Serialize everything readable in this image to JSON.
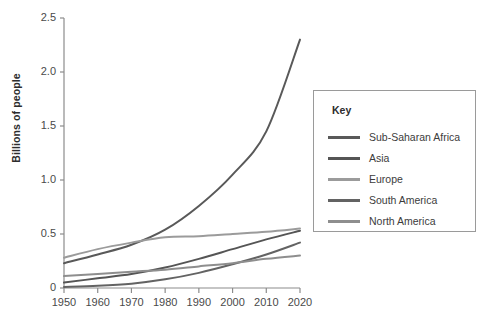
{
  "chart_data": {
    "type": "line",
    "title": "",
    "xlabel": "",
    "ylabel": "Billions of people",
    "xlim": [
      1950,
      2020
    ],
    "ylim": [
      0,
      2.5
    ],
    "grid": false,
    "legend_position": "right",
    "legend_title": "Key",
    "x": [
      1950,
      1960,
      1970,
      1980,
      1990,
      2000,
      2010,
      2020
    ],
    "xticklabels": [
      "1950",
      "1960",
      "1970",
      "1980",
      "1990",
      "2000",
      "2010",
      "2020"
    ],
    "yticks": [
      0,
      0.5,
      1.0,
      1.5,
      2.0,
      2.5
    ],
    "yticklabels": [
      "0",
      "0.5",
      "1.0",
      "1.5",
      "2.0",
      "2.5"
    ],
    "series": [
      {
        "name": "Sub-Saharan Africa",
        "color": "#595959",
        "values": [
          0.23,
          0.31,
          0.4,
          0.54,
          0.76,
          1.05,
          1.45,
          2.3
        ]
      },
      {
        "name": "Asia",
        "color": "#555555",
        "values": [
          0.05,
          0.09,
          0.13,
          0.19,
          0.27,
          0.36,
          0.45,
          0.53
        ]
      },
      {
        "name": "Europe",
        "color": "#9b9b9b",
        "values": [
          0.28,
          0.36,
          0.42,
          0.47,
          0.48,
          0.5,
          0.52,
          0.55
        ]
      },
      {
        "name": "South America",
        "color": "#636363",
        "values": [
          0.01,
          0.02,
          0.04,
          0.08,
          0.14,
          0.22,
          0.31,
          0.42
        ]
      },
      {
        "name": "North America",
        "color": "#8e8e8e",
        "values": [
          0.11,
          0.13,
          0.15,
          0.17,
          0.2,
          0.23,
          0.27,
          0.3
        ]
      }
    ]
  },
  "axes": {
    "y_title": "Billions of people"
  },
  "legend": {
    "title": "Key",
    "items": [
      {
        "label": "Sub-Saharan Africa",
        "color": "#595959"
      },
      {
        "label": "Asia",
        "color": "#555555"
      },
      {
        "label": "Europe",
        "color": "#9b9b9b"
      },
      {
        "label": "South America",
        "color": "#636363"
      },
      {
        "label": "North America",
        "color": "#8e8e8e"
      }
    ]
  },
  "colors": {
    "axis": "#8c8c8c",
    "text": "#3a3a3a",
    "legend_border": "#9a9a9a",
    "background": "#ffffff"
  }
}
